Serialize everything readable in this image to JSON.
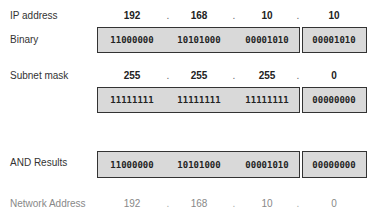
{
  "rows": {
    "ip": {
      "label": "IP address",
      "octets": [
        "192",
        "168",
        "10",
        "10"
      ]
    },
    "ip_binary": {
      "label": "Binary",
      "octets": [
        "11000000",
        "10101000",
        "00001010",
        "00001010"
      ]
    },
    "mask": {
      "label": "Subnet mask",
      "octets": [
        "255",
        "255",
        "255",
        "0"
      ]
    },
    "mask_binary": {
      "label": "",
      "octets": [
        "11111111",
        "11111111",
        "11111111",
        "00000000"
      ]
    },
    "and_result": {
      "label": "AND Results",
      "octets": [
        "11000000",
        "10101000",
        "00001010",
        "00000000"
      ]
    },
    "network": {
      "label": "Network Address",
      "octets": [
        "192",
        "168",
        "10",
        "0"
      ]
    }
  },
  "separator": ".",
  "colors": {
    "box_fill": "#d9d9d9",
    "box_border": "#333333",
    "muted_text": "#888888"
  }
}
